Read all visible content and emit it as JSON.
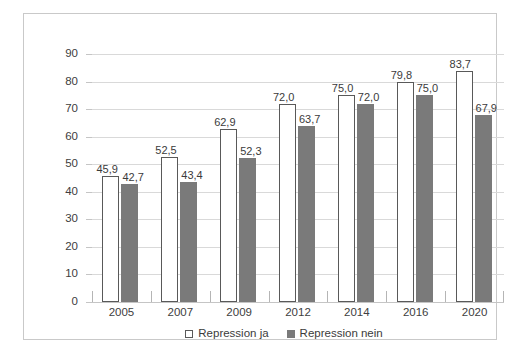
{
  "chart_data": {
    "type": "bar",
    "title": "",
    "subtitle": "",
    "xlabel": "",
    "ylabel": "",
    "categories": [
      "2005",
      "2007",
      "2009",
      "2012",
      "2014",
      "2016",
      "2020"
    ],
    "series": [
      {
        "name": "Repression ja",
        "color": "#ffffff",
        "border_color": "#595959",
        "values": [
          45.9,
          52.5,
          62.9,
          72.0,
          75.0,
          79.8,
          83.7
        ],
        "labels": [
          "45,9",
          "52,5",
          "62,9",
          "72,0",
          "75,0",
          "79,8",
          "83,7"
        ]
      },
      {
        "name": "Repression nein",
        "color": "#7a7a7a",
        "border_color": "#7a7a7a",
        "values": [
          42.7,
          43.4,
          52.3,
          63.7,
          72.0,
          75.0,
          67.9
        ],
        "labels": [
          "42,7",
          "43,4",
          "52,3",
          "63,7",
          "72,0",
          "75,0",
          "67,9"
        ]
      }
    ],
    "ylim": [
      0,
      90
    ],
    "ytick_step": 10,
    "yticks": [
      90,
      80,
      70,
      60,
      50,
      40,
      30,
      20,
      10,
      0
    ],
    "ytick_labels": [
      "90",
      "80",
      "70",
      "60",
      "50",
      "40",
      "30",
      "20",
      "10",
      "0"
    ],
    "grid": true,
    "grid_axis": "y",
    "grid_color": "#d9d9d9",
    "legend_position": "bottom",
    "legend": [
      {
        "label": "Repression ja",
        "swatch": "open-square-swatch"
      },
      {
        "label": "Repression nein",
        "swatch": "filled-square-swatch"
      }
    ],
    "background_color": "#ffffff",
    "frame_color": "#c9c9c9",
    "data_label_format": "comma-decimal"
  }
}
